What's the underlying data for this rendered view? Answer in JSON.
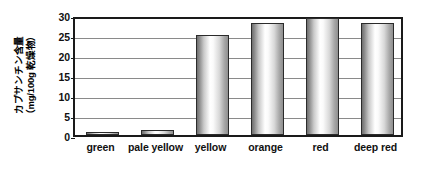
{
  "chart_data": {
    "type": "bar",
    "title": "",
    "xlabel": "",
    "ylabel": "カプサンチン含量（mg/100g 乾燥物）",
    "ylabel_line1": "カプサンチン含量",
    "ylabel_line2": "（mg/100g 乾燥物）",
    "categories": [
      "green",
      "pale yellow",
      "yellow",
      "orange",
      "red",
      "deep red"
    ],
    "values": [
      0.7,
      1.3,
      25.0,
      28.0,
      29.3,
      28.0
    ],
    "ylim": [
      0,
      30
    ],
    "yticks": [
      0,
      5,
      10,
      15,
      20,
      25,
      30
    ],
    "ytick_labels": [
      "0",
      "5",
      "10",
      "15",
      "20",
      "25",
      "30"
    ],
    "grid": true,
    "legend": "none",
    "bar_style": "cylinder-gradient",
    "colors": {
      "bar_edge": "#2b2b2b",
      "bar_highlight": "#ffffff",
      "bar_shade": "#8f8f8f",
      "frame": "#1a1a1a",
      "gridline": "#8a8a8a",
      "text": "#111111",
      "background": "#ffffff"
    }
  }
}
